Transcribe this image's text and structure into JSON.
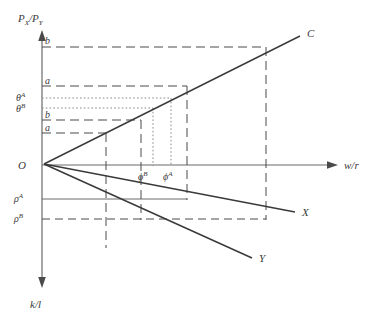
{
  "figure": {
    "type": "economics-diagram"
  },
  "axes": {
    "y_top_label": "P",
    "y_top_sub1": "X",
    "y_top_slash": "/P",
    "y_top_sub2": "Y",
    "y_bottom_label": "k/l",
    "x_right_label": "w/r",
    "origin_label": "O"
  },
  "ticks": {
    "left": [
      {
        "id": "b-upper",
        "label": "b",
        "sup": "",
        "y": 47
      },
      {
        "id": "a-upper",
        "label": "a",
        "sup": "",
        "y": 86
      },
      {
        "id": "theta-A",
        "label": "θ",
        "sup": "A",
        "y": 98
      },
      {
        "id": "theta-B",
        "label": "θ",
        "sup": "B",
        "y": 108
      },
      {
        "id": "b-lower",
        "label": "b",
        "sup": "",
        "y": 120
      },
      {
        "id": "a-lower",
        "label": "a",
        "sup": "",
        "y": 133
      },
      {
        "id": "rho-A",
        "label": "ρ",
        "sup": "A",
        "y": 199
      },
      {
        "id": "rho-B",
        "label": "ρ",
        "sup": "B",
        "y": 219
      }
    ]
  },
  "curves": [
    {
      "id": "curve-C",
      "label": "C"
    },
    {
      "id": "curve-X",
      "label": "X"
    },
    {
      "id": "curve-Y",
      "label": "Y"
    }
  ],
  "annotations": [
    {
      "id": "phi-B",
      "label": "ϕ",
      "sup": "B"
    },
    {
      "id": "phi-A",
      "label": "ϕ",
      "sup": "A"
    }
  ],
  "colors": {
    "line": "#3a3a3a",
    "axis": "#555555",
    "dashed": "#4a4a4a",
    "dotted": "#8a8a8a",
    "background": "#ffffff"
  }
}
